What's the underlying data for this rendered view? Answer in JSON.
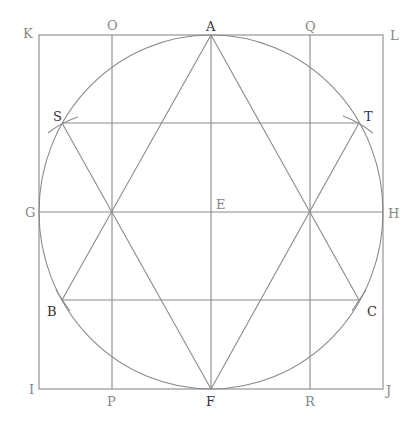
{
  "diagram": {
    "type": "geometric construction",
    "colors": {
      "line": "#8a8a8a",
      "label_light": "#888888",
      "label_dark": "#333333",
      "background": "#ffffff"
    },
    "square": {
      "corners": [
        "K",
        "L",
        "J",
        "I"
      ],
      "x1": 39,
      "y1": 35,
      "x2": 383,
      "y2": 389
    },
    "circle": {
      "center_label": "E",
      "cx": 211,
      "cy": 212,
      "r": 174
    },
    "points": {
      "A": {
        "label": "A",
        "x": 211,
        "y": 35
      },
      "F": {
        "label": "F",
        "x": 211,
        "y": 389
      },
      "E": {
        "label": "E",
        "x": 211,
        "y": 212
      },
      "G": {
        "label": "G",
        "x": 39,
        "y": 212
      },
      "H": {
        "label": "H",
        "x": 383,
        "y": 212
      },
      "K": {
        "label": "K",
        "x": 39,
        "y": 35
      },
      "L": {
        "label": "L",
        "x": 383,
        "y": 35
      },
      "I": {
        "label": "I",
        "x": 39,
        "y": 389
      },
      "J": {
        "label": "J",
        "x": 383,
        "y": 389
      },
      "O": {
        "label": "O",
        "x": 112,
        "y": 35
      },
      "P": {
        "label": "P",
        "x": 112,
        "y": 389
      },
      "Q": {
        "label": "Q",
        "x": 310,
        "y": 35
      },
      "R": {
        "label": "R",
        "x": 310,
        "y": 389
      },
      "S": {
        "label": "S",
        "x": 62,
        "y": 123
      },
      "T": {
        "label": "T",
        "x": 359,
        "y": 123
      },
      "B": {
        "label": "B",
        "x": 62,
        "y": 300
      },
      "C": {
        "label": "C",
        "x": 359,
        "y": 300
      }
    },
    "labels": {
      "K": "K",
      "O": "O",
      "A": "A",
      "Q": "Q",
      "L": "L",
      "S": "S",
      "T": "T",
      "G": "G",
      "E": "E",
      "H": "H",
      "B": "B",
      "C": "C",
      "I": "I",
      "P": "P",
      "F": "F",
      "R": "R",
      "J": "J"
    },
    "lines": [
      "KL",
      "LJ",
      "JI",
      "IK",
      "OP",
      "QR",
      "AF",
      "GH",
      "ST",
      "BC",
      "AB",
      "AC",
      "BC",
      "FS",
      "FT",
      "ST"
    ]
  }
}
